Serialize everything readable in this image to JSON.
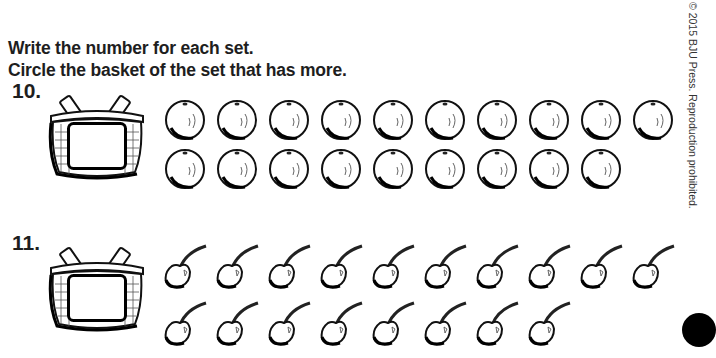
{
  "instructions": {
    "line1": "Write the number for each set.",
    "line2": "Circle the basket of the set that has more."
  },
  "copyright": "© 2015 BJU Press. Reproduction prohibited.",
  "problems": [
    {
      "number": "10.",
      "item_type": "orange",
      "rows": [
        10,
        9
      ],
      "total": 19,
      "answer_value": ""
    },
    {
      "number": "11.",
      "item_type": "cherry",
      "rows": [
        10,
        8
      ],
      "total": 18,
      "answer_value": ""
    }
  ],
  "colors": {
    "ink": "#1e1e1e",
    "paper": "#ffffff",
    "page_marker": "#000000"
  }
}
